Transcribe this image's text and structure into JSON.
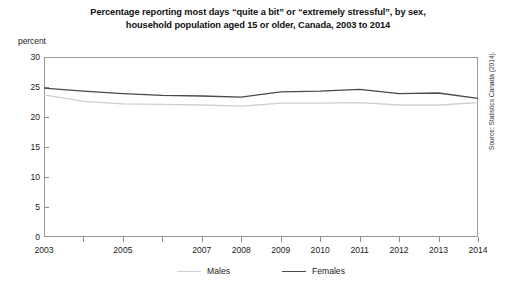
{
  "chart_data": {
    "type": "line",
    "title": "Percentage reporting most days “quite a bit” or “extremely stressful”, by sex, household population aged 15 or older, Canada, 2003 to 2014",
    "title_lines": [
      "Percentage reporting most days “quite a bit” or “extremely stressful”, by sex,",
      "household population aged 15 or older, Canada, 2003 to 2014"
    ],
    "xlabel": "",
    "ylabel": "percent",
    "ylim": [
      0,
      30
    ],
    "yticks": [
      0,
      5,
      10,
      15,
      20,
      25,
      30
    ],
    "ytick_labels": [
      "0",
      "5",
      "10",
      "15",
      "20",
      "25",
      "30"
    ],
    "grid": false,
    "legend_position": "bottom",
    "x": [
      2003,
      2004,
      2005,
      2006,
      2007,
      2008,
      2009,
      2010,
      2011,
      2012,
      2013,
      2014
    ],
    "categories": [
      "2003",
      "2004",
      "2005",
      "2006",
      "2007",
      "2008",
      "2009",
      "2010",
      "2011",
      "2012",
      "2013",
      "2014"
    ],
    "xtick_labels": [
      "2003",
      "",
      "2005",
      "",
      "2007",
      "2008",
      "2009",
      "2010",
      "2011",
      "2012",
      "2013",
      "2014"
    ],
    "series": [
      {
        "name": "Males",
        "color": "#cfcfcf",
        "values": [
          23.7,
          22.6,
          22.2,
          22.1,
          22.0,
          21.8,
          22.3,
          22.3,
          22.4,
          22.0,
          22.0,
          22.4
        ]
      },
      {
        "name": "Females",
        "color": "#4a4a4a",
        "values": [
          24.8,
          24.3,
          23.9,
          23.6,
          23.5,
          23.3,
          24.2,
          24.3,
          24.6,
          23.9,
          24.0,
          23.1
        ]
      }
    ],
    "source": "Source: Statistics Canada (2014)."
  }
}
